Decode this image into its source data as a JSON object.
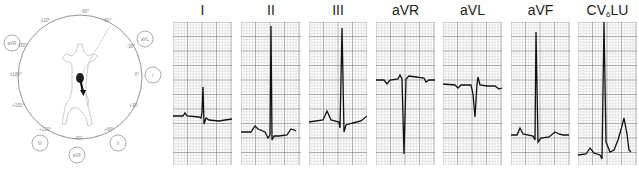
{
  "figure": {
    "hexaxial": {
      "angle_labels": [
        {
          "label": "-90°",
          "x": 85,
          "y": 13
        },
        {
          "label": "-120°",
          "x": 45,
          "y": 22
        },
        {
          "label": "-60°",
          "x": 107,
          "y": 22
        },
        {
          "label": "-150°",
          "x": 22,
          "y": 47
        },
        {
          "label": "-30°",
          "x": 131,
          "y": 48
        },
        {
          "label": "±180°",
          "x": 16,
          "y": 76
        },
        {
          "label": "0°",
          "x": 137,
          "y": 76
        },
        {
          "label": "+150°",
          "x": 18,
          "y": 107
        },
        {
          "label": "+30°",
          "x": 134,
          "y": 107
        },
        {
          "label": "+120°",
          "x": 45,
          "y": 131
        },
        {
          "label": "+60°",
          "x": 109,
          "y": 131
        },
        {
          "label": "+90°",
          "x": 78,
          "y": 140
        }
      ],
      "lead_circles": [
        {
          "label": "aVR",
          "cx": 12,
          "cy": 43
        },
        {
          "label": "aVL",
          "cx": 145,
          "cy": 39
        },
        {
          "label": "I",
          "cx": 153,
          "cy": 75
        },
        {
          "label": "III",
          "cx": 40,
          "cy": 143
        },
        {
          "label": "aVF",
          "cx": 77,
          "cy": 155
        },
        {
          "label": "II",
          "cx": 118,
          "cy": 143
        }
      ],
      "axis_arrow": "mean-electrical-axis"
    },
    "leads": [
      {
        "name": "I",
        "x": 173,
        "w": 59
      },
      {
        "name": "II",
        "x": 241,
        "w": 60
      },
      {
        "name": "III",
        "x": 309,
        "w": 58
      },
      {
        "name": "aVR",
        "x": 376,
        "w": 59
      },
      {
        "name": "aVL",
        "x": 443,
        "w": 59
      },
      {
        "name": "aVF",
        "x": 511,
        "w": 59
      },
      {
        "name": "CV",
        "sub": "6",
        "suffix": "LU",
        "x": 578,
        "w": 59
      }
    ],
    "colors": {
      "grid_minor": "#c8c8c8",
      "grid_major": "#8a8a8a",
      "trace": "#111111",
      "diagram_line": "#999999"
    }
  },
  "labels": {
    "lead_I": "I",
    "lead_II": "II",
    "lead_III": "III",
    "lead_aVR": "aVR",
    "lead_aVL": "aVL",
    "lead_aVF": "aVF",
    "lead_CV_prefix": "CV",
    "lead_CV_sub": "6",
    "lead_CV_suffix": "LU"
  }
}
